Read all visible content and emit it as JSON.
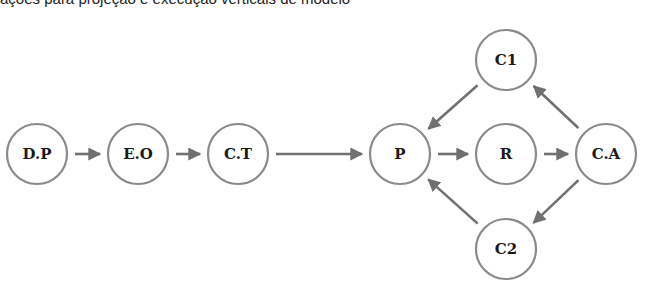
{
  "caption": "ações para projeção e execução verticais de modelo",
  "diagram": {
    "nodes": [
      {
        "id": "DP",
        "label": "D.P",
        "cx": 37,
        "cy": 154
      },
      {
        "id": "EO",
        "label": "E.O",
        "cx": 138,
        "cy": 154
      },
      {
        "id": "CT",
        "label": "C.T",
        "cx": 238,
        "cy": 154
      },
      {
        "id": "P",
        "label": "P",
        "cx": 400,
        "cy": 154
      },
      {
        "id": "R",
        "label": "R",
        "cx": 506,
        "cy": 154
      },
      {
        "id": "CA",
        "label": "C.A",
        "cx": 606,
        "cy": 154
      },
      {
        "id": "C1",
        "label": "C1",
        "cx": 506,
        "cy": 60
      },
      {
        "id": "C2",
        "label": "C2",
        "cx": 506,
        "cy": 249
      }
    ],
    "edges": [
      {
        "from": "DP",
        "to": "EO"
      },
      {
        "from": "EO",
        "to": "CT"
      },
      {
        "from": "CT",
        "to": "P"
      },
      {
        "from": "P",
        "to": "R"
      },
      {
        "from": "R",
        "to": "CA"
      },
      {
        "from": "CA",
        "to": "C1"
      },
      {
        "from": "C1",
        "to": "P"
      },
      {
        "from": "CA",
        "to": "C2"
      },
      {
        "from": "C2",
        "to": "P"
      }
    ],
    "colors": {
      "node_stroke": "#8a8a8a",
      "edge": "#707070",
      "text": "#1a1a1a"
    }
  }
}
